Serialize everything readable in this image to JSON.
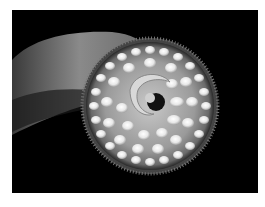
{
  "image": {
    "subject": "lamprey-oral-disc",
    "alt": "Close-up of a lamprey's circular sucker mouth with concentric rows of teeth",
    "background_color": "#000000",
    "page_color": "#ffffff"
  }
}
